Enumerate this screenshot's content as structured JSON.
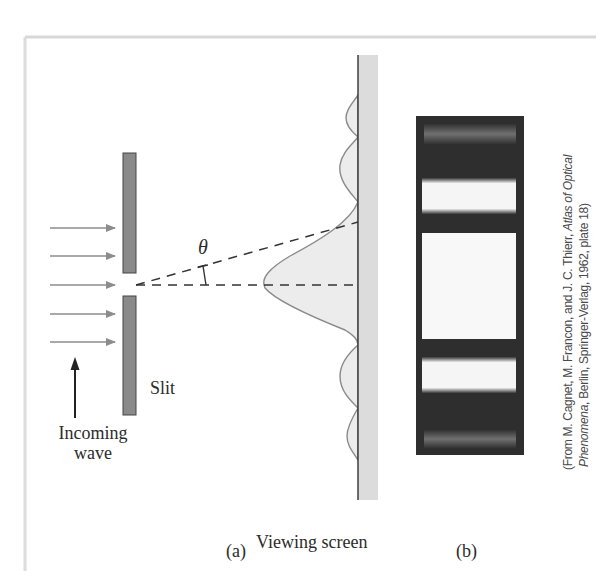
{
  "figure": {
    "panel_a": {
      "caption": "(a)",
      "labels": {
        "slit": "Slit",
        "incoming_line1": "Incoming",
        "incoming_line2": "wave",
        "theta": "θ",
        "viewing_screen": "Viewing screen"
      },
      "incident_arrows_count": 5,
      "colors": {
        "slit_fill": "#8a8a8a",
        "arrow": "#8c8c8c",
        "dashed_line": "#333333",
        "intensity_fill": "#ececec",
        "intensity_stroke": "#8a8a8a",
        "screen_strip": "#dcdcdc"
      }
    },
    "panel_b": {
      "caption": "(b)",
      "description": "Photograph of single-slit diffraction pattern: central bright fringe with weaker secondary fringes above and below",
      "colors": {
        "background": "#2e2e2e",
        "bright": "#f8f8f8",
        "faint": "#7a7a7a"
      }
    },
    "credit": {
      "line1_prefix": "(From M. Cagnet, M. Francon, and J. C. Thierr, ",
      "line1_italic": "Atlas of Optical",
      "line2_italic": "Phenomena",
      "line2_suffix": ", Berlin, Springer-Verlag, 1962, plate 18)"
    },
    "border_color": "#d8d8d8"
  }
}
